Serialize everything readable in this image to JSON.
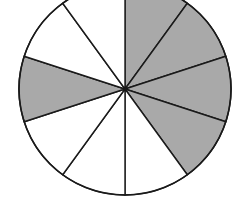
{
  "diagram": {
    "type": "fraction-circle",
    "total_sectors": 10,
    "sector_angle_deg": 36,
    "start_angle_deg": 0,
    "direction": "clockwise-from-top",
    "center": [
      125,
      89
    ],
    "radius": 106,
    "shaded_sectors": [
      0,
      1,
      2,
      3,
      7
    ],
    "shaded_count": 5,
    "colors": {
      "shaded": "#a9a9a9",
      "unshaded": "#ffffff",
      "stroke": "#1a1a1a"
    }
  }
}
